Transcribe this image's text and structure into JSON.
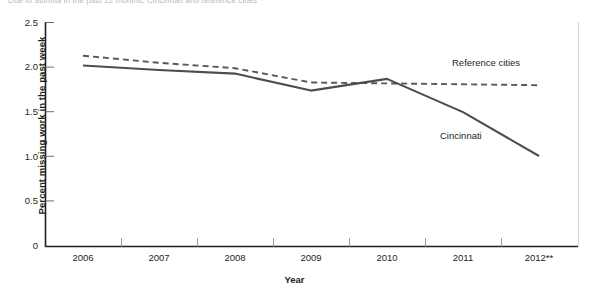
{
  "top_caption": "Due to asthma in the past 12 months, Cincinnati and reference cities",
  "chart_data": {
    "type": "line",
    "title": "",
    "xlabel": "Year",
    "ylabel": "Percent missing work in the past week",
    "categories": [
      "2006",
      "2007",
      "2008",
      "2009",
      "2010",
      "2011",
      "2012**"
    ],
    "ylim": [
      0,
      2.5
    ],
    "yticks": [
      "0",
      "0.5",
      "1.0",
      "1.5",
      "2.0",
      "2.5"
    ],
    "ytick_values": [
      0,
      0.5,
      1.0,
      1.5,
      2.0,
      2.5
    ],
    "grid": false,
    "legend_position": "inline-annotation",
    "series": [
      {
        "name": "Reference cities",
        "style": "dashed",
        "color": "#595959",
        "values": [
          2.13,
          2.05,
          1.99,
          1.83,
          1.82,
          1.81,
          1.8
        ]
      },
      {
        "name": "Cincinnati",
        "style": "solid",
        "color": "#4d4d4d",
        "values": [
          2.02,
          1.97,
          1.93,
          1.74,
          1.87,
          1.5,
          1.01
        ]
      }
    ],
    "annotations": [
      {
        "text": "Reference cities",
        "series": "Reference cities"
      },
      {
        "text": "Cincinnati",
        "series": "Cincinnati"
      }
    ],
    "footnote_marker": "**"
  },
  "colors": {
    "axis": "#231f20",
    "cincinnati": "#4d4d4d",
    "reference": "#595959",
    "text": "#231f20"
  }
}
